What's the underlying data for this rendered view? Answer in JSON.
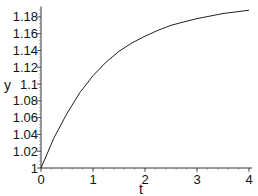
{
  "chart_data": {
    "type": "line",
    "title": "",
    "xlabel": "t",
    "ylabel": "y",
    "xlim": [
      0,
      4
    ],
    "ylim": [
      1,
      1.19
    ],
    "grid": false,
    "legend": "none",
    "x_ticks": [
      "0",
      "1",
      "2",
      "3",
      "4"
    ],
    "y_ticks": [
      "1",
      "1.02",
      "1.04",
      "1.06",
      "1.08",
      "1.1",
      "1.12",
      "1.14",
      "1.16",
      "1.18"
    ],
    "series": [
      {
        "name": "y(t)",
        "color": "#222222",
        "x": [
          0,
          0.25,
          0.5,
          0.75,
          1,
          1.25,
          1.5,
          1.75,
          2,
          2.25,
          2.5,
          2.75,
          3,
          3.25,
          3.5,
          3.75,
          4
        ],
        "y": [
          1.0,
          1.036,
          1.065,
          1.09,
          1.11,
          1.126,
          1.139,
          1.149,
          1.157,
          1.164,
          1.17,
          1.174,
          1.178,
          1.181,
          1.184,
          1.186,
          1.188
        ]
      }
    ]
  }
}
